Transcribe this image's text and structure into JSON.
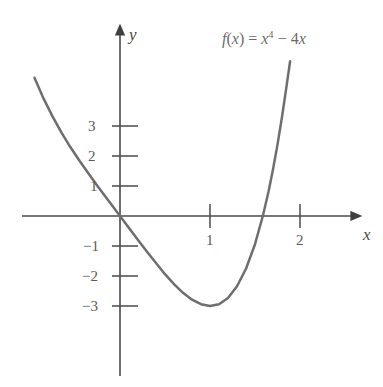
{
  "figure": {
    "function_label": "f(x) = x⁴ − 4x",
    "x_axis_name": "x",
    "y_axis_name": "y",
    "curve_color": "#6e6e6e",
    "axis_color": "#4a4a4a",
    "background_color": "#ffffff"
  },
  "labels": {
    "fn_f": "f",
    "fn_open": "(",
    "fn_var": "x",
    "fn_close": ")",
    "fn_equals": " = ",
    "fn_base": "x",
    "fn_exp": "4",
    "fn_minus": " − 4",
    "fn_tail": "x"
  },
  "chart_data": {
    "type": "line",
    "title": "",
    "subtitle": "",
    "xlabel": "x",
    "ylabel": "y",
    "annotations": [
      "f(x) = x⁴ − 4x"
    ],
    "legend": [],
    "legend_position": "none",
    "grid": false,
    "xlim": [
      -1.1,
      2.65
    ],
    "ylim": [
      -4.5,
      5.6
    ],
    "xticks": [
      1,
      2
    ],
    "xtick_labels": [
      "1",
      "2"
    ],
    "yticks": [
      3,
      2,
      1,
      -1,
      -2,
      -3
    ],
    "ytick_labels": [
      "3",
      "2",
      "1",
      "−1",
      "−2",
      "−3"
    ],
    "series": [
      {
        "name": "f(x) = x⁴ − 4x",
        "expression": "x^4 - 4x",
        "color": "#6e6e6e",
        "x": [
          -0.95,
          -0.85,
          -0.75,
          -0.65,
          -0.55,
          -0.45,
          -0.35,
          -0.25,
          -0.15,
          -0.05,
          0.0,
          0.1,
          0.2,
          0.3,
          0.4,
          0.5,
          0.6,
          0.7,
          0.8,
          0.9,
          1.0,
          1.1,
          1.2,
          1.3,
          1.4,
          1.5,
          1.587,
          1.65,
          1.7,
          1.75,
          1.8,
          1.85,
          1.89
        ],
        "y": [
          4.61,
          3.92,
          3.32,
          2.78,
          2.29,
          1.84,
          1.42,
          1.0,
          0.6,
          0.2,
          0.0,
          -0.4,
          -0.8,
          -1.19,
          -1.57,
          -1.94,
          -2.27,
          -2.56,
          -2.79,
          -2.94,
          -3.0,
          -2.94,
          -2.73,
          -2.34,
          -1.76,
          -0.94,
          0.0,
          0.81,
          1.55,
          2.38,
          3.3,
          4.32,
          5.16
        ],
        "key_points": [
          {
            "label": "origin x-intercept",
            "x": 0,
            "y": 0
          },
          {
            "label": "minimum",
            "x": 1,
            "y": -3
          },
          {
            "label": "x-intercept",
            "x": 1.587,
            "y": 0
          }
        ]
      }
    ]
  }
}
